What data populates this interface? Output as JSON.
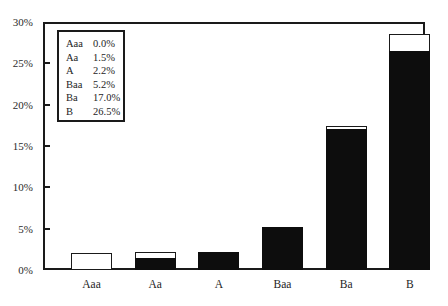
{
  "chart_data": {
    "type": "bar",
    "title": "",
    "xlabel": "",
    "ylabel": "",
    "categories": [
      "Aaa",
      "Aa",
      "A",
      "Baa",
      "Ba",
      "B"
    ],
    "values": [
      0.0,
      1.5,
      2.2,
      5.2,
      17.0,
      26.5
    ],
    "series": [
      {
        "name": "Filled (black)",
        "values": [
          0.0,
          1.5,
          2.2,
          5.2,
          17.0,
          26.5
        ]
      },
      {
        "name": "Outline total (white)",
        "values": [
          2.0,
          2.2,
          2.2,
          5.2,
          17.4,
          28.5
        ]
      }
    ],
    "ylim": [
      0,
      30
    ],
    "yticks": [
      0,
      5,
      10,
      15,
      20,
      25,
      30
    ],
    "ytick_labels": [
      "0%",
      "5%",
      "10%",
      "15%",
      "20%",
      "25%",
      "30%"
    ],
    "grid": false,
    "legend_position": "upper-left",
    "bar_fill_color": "#0d0d0d",
    "bar_outline_color": "#1a1a1a",
    "background_color": "#ffffff"
  },
  "legend": {
    "rows": [
      {
        "rating": "Aaa",
        "value": "0.0%"
      },
      {
        "rating": "Aa",
        "value": "1.5%"
      },
      {
        "rating": "A",
        "value": "2.2%"
      },
      {
        "rating": "Baa",
        "value": "5.2%"
      },
      {
        "rating": "Ba",
        "value": "17.0%"
      },
      {
        "rating": "B",
        "value": "26.5%"
      }
    ]
  },
  "axes": {
    "y_ticks": [
      "0%",
      "5%",
      "10%",
      "15%",
      "20%",
      "25%",
      "30%"
    ],
    "x_ticks": [
      "Aaa",
      "Aa",
      "A",
      "Baa",
      "Ba",
      "B"
    ]
  }
}
